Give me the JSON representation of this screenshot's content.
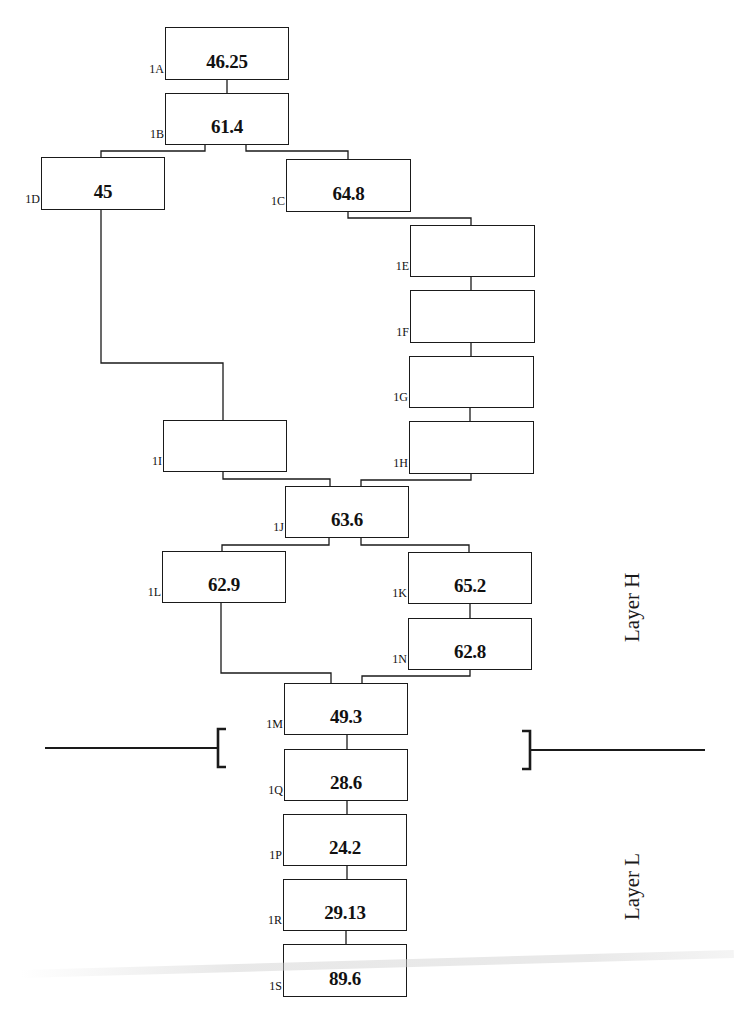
{
  "diagram": {
    "type": "flow-tree",
    "colors": {
      "line": "#1a1a1a",
      "box_border": "#1a1a1a",
      "text": "#111111",
      "background": "#ffffff"
    },
    "nodes": [
      {
        "id": "1A",
        "label": "1A",
        "value": "46.25",
        "x": 165,
        "y": 27,
        "w": 124,
        "h": 53
      },
      {
        "id": "1B",
        "label": "1B",
        "value": "61.4",
        "x": 165,
        "y": 93,
        "w": 124,
        "h": 52
      },
      {
        "id": "1D",
        "label": "1D",
        "value": "45",
        "x": 41,
        "y": 157,
        "w": 124,
        "h": 53
      },
      {
        "id": "1C",
        "label": "1C",
        "value": "64.8",
        "x": 286,
        "y": 159,
        "w": 125,
        "h": 53
      },
      {
        "id": "1E",
        "label": "1E",
        "value": "",
        "x": 410,
        "y": 225,
        "w": 125,
        "h": 52
      },
      {
        "id": "1F",
        "label": "1F",
        "value": "",
        "x": 410,
        "y": 290,
        "w": 125,
        "h": 53
      },
      {
        "id": "1G",
        "label": "1G",
        "value": "",
        "x": 409,
        "y": 356,
        "w": 125,
        "h": 52
      },
      {
        "id": "1I",
        "label": "1I",
        "value": "",
        "x": 163,
        "y": 420,
        "w": 124,
        "h": 52
      },
      {
        "id": "1H",
        "label": "1H",
        "value": "",
        "x": 409,
        "y": 421,
        "w": 125,
        "h": 53
      },
      {
        "id": "1J",
        "label": "1J",
        "value": "63.6",
        "x": 285,
        "y": 486,
        "w": 124,
        "h": 52
      },
      {
        "id": "1L",
        "label": "1L",
        "value": "62.9",
        "x": 162,
        "y": 551,
        "w": 124,
        "h": 52
      },
      {
        "id": "1K",
        "label": "1K",
        "value": "65.2",
        "x": 408,
        "y": 552,
        "w": 124,
        "h": 52
      },
      {
        "id": "1N",
        "label": "1N",
        "value": "62.8",
        "x": 408,
        "y": 618,
        "w": 124,
        "h": 52
      },
      {
        "id": "1M",
        "label": "1M",
        "value": "49.3",
        "x": 284,
        "y": 683,
        "w": 124,
        "h": 52
      },
      {
        "id": "1Q",
        "label": "1Q",
        "value": "28.6",
        "x": 284,
        "y": 749,
        "w": 124,
        "h": 52
      },
      {
        "id": "1P",
        "label": "1P",
        "value": "24.2",
        "x": 283,
        "y": 814,
        "w": 124,
        "h": 52
      },
      {
        "id": "1R",
        "label": "1R",
        "value": "29.13",
        "x": 283,
        "y": 879,
        "w": 124,
        "h": 52
      },
      {
        "id": "1S",
        "label": "1S",
        "value": "89.6",
        "x": 283,
        "y": 944,
        "w": 124,
        "h": 53
      }
    ],
    "connectors": [
      {
        "from": "1A",
        "to": "1B",
        "path": [
          [
            227,
            80
          ],
          [
            227,
            93
          ]
        ]
      },
      {
        "from": "1B",
        "to": "1D",
        "path": [
          [
            205,
            145
          ],
          [
            205,
            151
          ],
          [
            101,
            151
          ],
          [
            101,
            157
          ]
        ]
      },
      {
        "from": "1B",
        "to": "1C",
        "path": [
          [
            246,
            145
          ],
          [
            246,
            151
          ],
          [
            348,
            151
          ],
          [
            348,
            159
          ]
        ]
      },
      {
        "from": "1C",
        "to": "1E",
        "path": [
          [
            348,
            212
          ],
          [
            348,
            218
          ],
          [
            471,
            218
          ],
          [
            471,
            225
          ]
        ]
      },
      {
        "from": "1E",
        "to": "1F",
        "path": [
          [
            471,
            277
          ],
          [
            471,
            290
          ]
        ]
      },
      {
        "from": "1F",
        "to": "1G",
        "path": [
          [
            471,
            343
          ],
          [
            471,
            356
          ]
        ]
      },
      {
        "from": "1G",
        "to": "1H",
        "path": [
          [
            470,
            408
          ],
          [
            470,
            421
          ]
        ]
      },
      {
        "from": "1D",
        "to": "1I",
        "path": [
          [
            101,
            210
          ],
          [
            101,
            363
          ],
          [
            223,
            363
          ],
          [
            223,
            420
          ]
        ]
      },
      {
        "from": "1I",
        "to": "1J",
        "path": [
          [
            223,
            472
          ],
          [
            223,
            479
          ],
          [
            330,
            479
          ],
          [
            330,
            486
          ]
        ]
      },
      {
        "from": "1H",
        "to": "1J",
        "path": [
          [
            471,
            474
          ],
          [
            471,
            480
          ],
          [
            361,
            480
          ],
          [
            361,
            486
          ]
        ]
      },
      {
        "from": "1J",
        "to": "1L",
        "path": [
          [
            329,
            538
          ],
          [
            329,
            545
          ],
          [
            222,
            545
          ],
          [
            222,
            551
          ]
        ]
      },
      {
        "from": "1J",
        "to": "1K",
        "path": [
          [
            361,
            538
          ],
          [
            361,
            545
          ],
          [
            469,
            545
          ],
          [
            469,
            552
          ]
        ]
      },
      {
        "from": "1K",
        "to": "1N",
        "path": [
          [
            470,
            604
          ],
          [
            470,
            618
          ]
        ]
      },
      {
        "from": "1L",
        "to": "1M",
        "path": [
          [
            221,
            603
          ],
          [
            221,
            673
          ],
          [
            331,
            673
          ],
          [
            331,
            683
          ]
        ]
      },
      {
        "from": "1N",
        "to": "1M",
        "path": [
          [
            470,
            670
          ],
          [
            470,
            676
          ],
          [
            362,
            676
          ],
          [
            362,
            683
          ]
        ]
      },
      {
        "from": "1M",
        "to": "1Q",
        "path": [
          [
            347,
            735
          ],
          [
            347,
            749
          ]
        ]
      },
      {
        "from": "1Q",
        "to": "1P",
        "path": [
          [
            347,
            801
          ],
          [
            347,
            814
          ]
        ]
      },
      {
        "from": "1P",
        "to": "1R",
        "path": [
          [
            347,
            866
          ],
          [
            347,
            879
          ]
        ]
      },
      {
        "from": "1R",
        "to": "1S",
        "path": [
          [
            346,
            931
          ],
          [
            346,
            944
          ]
        ]
      }
    ],
    "layer_divider": {
      "left_line": {
        "x1": 45,
        "y1": 748,
        "x2": 218,
        "y2": 748
      },
      "left_bracket": {
        "x": 218,
        "top": 729,
        "bottom": 767,
        "tick": 8
      },
      "right_line": {
        "x1": 531,
        "y1": 750,
        "x2": 705,
        "y2": 750
      },
      "right_bracket": {
        "x": 530,
        "top": 731,
        "bottom": 769,
        "tick": -8
      }
    },
    "layers": [
      {
        "name": "layer-h",
        "label": "Layer H",
        "x": 620,
        "y": 642
      },
      {
        "name": "layer-l",
        "label": "Layer L",
        "x": 620,
        "y": 920
      }
    ]
  }
}
